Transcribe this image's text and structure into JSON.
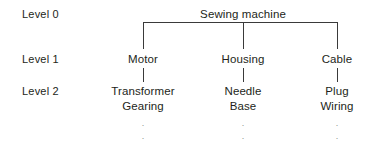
{
  "diagram": {
    "type": "hierarchy-tree",
    "title_node": "Sewing machine",
    "line_color": "#3a3a3a",
    "text_color": "#231f20",
    "background_color": "#ffffff",
    "levels": [
      {
        "label": "Level 0"
      },
      {
        "label": "Level 1"
      },
      {
        "label": "Level 2"
      }
    ],
    "root": {
      "label": "Sewing machine"
    },
    "branches": [
      {
        "level1": "Motor",
        "level2": [
          "Transformer",
          "Gearing"
        ],
        "continuation": "."
      },
      {
        "level1": "Housing",
        "level2": [
          "Needle",
          "Base"
        ],
        "continuation": "."
      },
      {
        "level1": "Cable",
        "level2": [
          "Plug",
          "Wiring"
        ],
        "continuation": "."
      }
    ]
  }
}
